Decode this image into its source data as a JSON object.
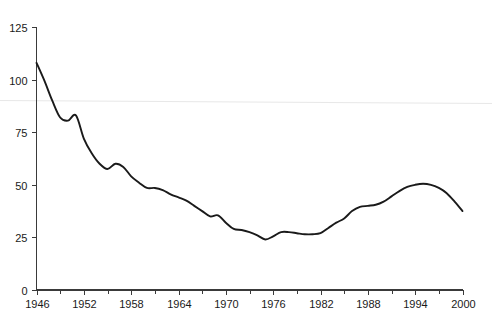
{
  "chart_data": {
    "type": "line",
    "title": "",
    "subtitle": "",
    "xlabel": "",
    "ylabel": "",
    "xlim": [
      1946,
      2000
    ],
    "ylim": [
      0,
      125
    ],
    "grid": false,
    "legend": null,
    "x_ticks_major": [
      1946,
      1952,
      1958,
      1964,
      1970,
      1976,
      1982,
      1988,
      1994,
      2000
    ],
    "x_ticks_minor": [
      1949,
      1955,
      1961,
      1967,
      1973,
      1979,
      1985,
      1991,
      1997
    ],
    "x_tick_labels": [
      "1946",
      "1952",
      "1958",
      "1964",
      "1970",
      "1976",
      "1982",
      "1988",
      "1994",
      "2000"
    ],
    "y_ticks": [
      0,
      25,
      50,
      75,
      100,
      125
    ],
    "y_tick_labels": [
      "0",
      "25",
      "50",
      "75",
      "100",
      "125"
    ],
    "line_color": "#1a1a1a",
    "series": [
      {
        "name": "series-1",
        "x": [
          1946,
          1947,
          1948,
          1949,
          1950,
          1951,
          1952,
          1953,
          1954,
          1955,
          1956,
          1957,
          1958,
          1959,
          1960,
          1961,
          1962,
          1963,
          1964,
          1965,
          1966,
          1967,
          1968,
          1969,
          1970,
          1971,
          1972,
          1973,
          1974,
          1975,
          1976,
          1977,
          1978,
          1979,
          1980,
          1981,
          1982,
          1983,
          1984,
          1985,
          1986,
          1987,
          1988,
          1989,
          1990,
          1991,
          1992,
          1993,
          1994,
          1995,
          1996,
          1997,
          1998,
          1999,
          2000
        ],
        "values": [
          108.0,
          99.5,
          90.0,
          82.0,
          80.5,
          83.0,
          72.0,
          65.0,
          60.0,
          57.5,
          60.0,
          58.5,
          54.0,
          51.0,
          48.5,
          48.5,
          47.5,
          45.5,
          44.0,
          42.5,
          40.0,
          37.5,
          35.0,
          35.5,
          32.0,
          29.0,
          28.5,
          27.5,
          26.0,
          24.0,
          25.5,
          27.5,
          27.5,
          27.0,
          26.5,
          26.5,
          27.0,
          29.5,
          32.0,
          34.0,
          37.5,
          39.5,
          40.0,
          40.5,
          42.0,
          44.5,
          47.0,
          49.0,
          50.0,
          50.5,
          50.0,
          48.5,
          46.0,
          42.0,
          37.5
        ]
      }
    ]
  },
  "axes": {
    "y_axis_name": "y-axis",
    "x_axis_name": "x-axis"
  }
}
